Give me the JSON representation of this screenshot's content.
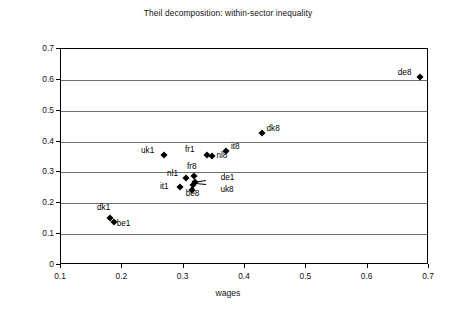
{
  "chart_data": {
    "type": "scatter",
    "title": "Theil decomposition: within-sector inequality",
    "xlabel": "wages",
    "ylabel": "earnings",
    "xlim": [
      0.1,
      0.7
    ],
    "ylim": [
      0,
      0.7
    ],
    "xticks": [
      "0.1",
      "0.2",
      "0.3",
      "0.4",
      "0.5",
      "0.6",
      "0.7"
    ],
    "yticks": [
      "0",
      "0.1",
      "0.2",
      "0.3",
      "0.4",
      "0.5",
      "0.6",
      "0.7"
    ],
    "grid": "horizontal",
    "legend": "none",
    "points": [
      {
        "label": "de8",
        "x": 0.685,
        "y": 0.61,
        "lx": -22,
        "ly": -4
      },
      {
        "label": "dk8",
        "x": 0.427,
        "y": 0.428,
        "lx": 5,
        "ly": -4
      },
      {
        "label": "it8",
        "x": 0.369,
        "y": 0.37,
        "lx": 5,
        "ly": -4
      },
      {
        "label": "uk1",
        "x": 0.268,
        "y": 0.356,
        "lx": -23,
        "ly": -4
      },
      {
        "label": "fr1",
        "x": 0.338,
        "y": 0.356,
        "lx": -22,
        "ly": -5
      },
      {
        "label": "nl8",
        "x": 0.347,
        "y": 0.353,
        "lx": 4,
        "ly": 0
      },
      {
        "label": "fr8",
        "x": 0.317,
        "y": 0.29,
        "lx": -7,
        "ly": -9
      },
      {
        "label": "nl1",
        "x": 0.304,
        "y": 0.281,
        "lx": -19,
        "ly": -4
      },
      {
        "label": "de1",
        "x": 0.318,
        "y": 0.268,
        "lx": 26,
        "ly": -4
      },
      {
        "label": "uk8",
        "x": 0.316,
        "y": 0.26,
        "lx": 27,
        "ly": 5
      },
      {
        "label": "it1",
        "x": 0.294,
        "y": 0.253,
        "lx": -20,
        "ly": 0
      },
      {
        "label": "be8",
        "x": 0.313,
        "y": 0.243,
        "lx": -6,
        "ly": 4
      },
      {
        "label": "dk1",
        "x": 0.18,
        "y": 0.152,
        "lx": -13,
        "ly": -10
      },
      {
        "label": "be1",
        "x": 0.186,
        "y": 0.139,
        "lx": 3,
        "ly": 2
      }
    ],
    "leaders": [
      {
        "from_label": "de1",
        "x1": 0.337,
        "y1": 0.272,
        "x2": 0.318,
        "y2": 0.266
      },
      {
        "from_label": "uk8",
        "x1": 0.337,
        "y1": 0.258,
        "x2": 0.316,
        "y2": 0.262
      }
    ]
  }
}
